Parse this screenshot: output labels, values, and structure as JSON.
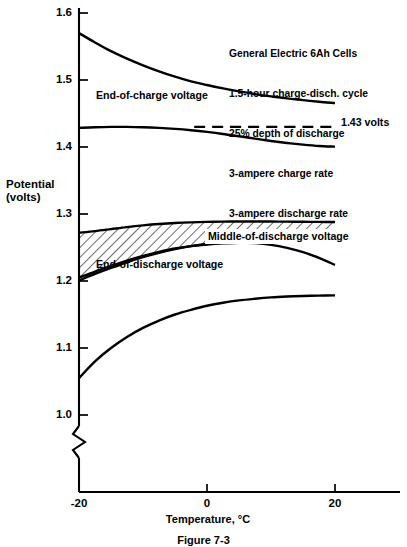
{
  "figure": {
    "caption": "Figure 7-3",
    "annotation_lines": [
      "General Electric 6Ah Cells",
      "1.5-hour charge-disch. cycle",
      "25% depth of discharge",
      "3-ampere charge rate",
      "3-ampere discharge rate"
    ]
  },
  "chart_data": {
    "type": "line",
    "title": "",
    "xlabel": "Temperature, °C",
    "ylabel_lines": [
      "Potential",
      "(volts)"
    ],
    "xlim": [
      -20,
      20
    ],
    "ylim": [
      1.0,
      1.6
    ],
    "xticks": [
      "-20",
      "0",
      "20"
    ],
    "xtick_values": [
      -20,
      0,
      20
    ],
    "yticks": [
      "1.0",
      "1.1",
      "1.2",
      "1.3",
      "1.4",
      "1.5",
      "1.6"
    ],
    "ytick_values": [
      1.0,
      1.1,
      1.2,
      1.3,
      1.4,
      1.5,
      1.6
    ],
    "grid": false,
    "legend": "none",
    "axis_break": {
      "present": true,
      "below_value": 1.0,
      "symbol": "zigzag"
    },
    "annotations": [
      {
        "text": "End-of-charge voltage",
        "x": -15.5,
        "y": 1.468
      },
      {
        "text": "Middle-of-discharge voltage",
        "x": 2.0,
        "y": 1.262
      },
      {
        "text": "End-of-discharge voltage",
        "x": -14.0,
        "y": 1.188
      },
      {
        "text": "1.43 volts",
        "x": 21.5,
        "y": 1.43
      }
    ],
    "series": [
      {
        "name": "End-of-charge voltage",
        "style": "solid",
        "x": [
          -20,
          -17.5,
          -15,
          -12.5,
          -10,
          -7.5,
          -5,
          -2.5,
          0,
          2.5,
          5,
          7.5,
          10,
          12.5,
          15,
          17.5,
          20
        ],
        "values": [
          1.57,
          1.556,
          1.543,
          1.532,
          1.522,
          1.513,
          1.505,
          1.498,
          1.4925,
          1.4875,
          1.483,
          1.479,
          1.4755,
          1.4725,
          1.47,
          1.4675,
          1.4655
        ]
      },
      {
        "name": "Upper discharge-plateau voltage",
        "style": "solid",
        "x": [
          -20,
          -17.5,
          -15,
          -12.5,
          -10,
          -7.5,
          -5,
          -2.5,
          0,
          2.5,
          5,
          7.5,
          10,
          12.5,
          15,
          17.5,
          20
        ],
        "values": [
          1.4285,
          1.4295,
          1.43,
          1.43,
          1.4295,
          1.4285,
          1.427,
          1.425,
          1.4225,
          1.4195,
          1.416,
          1.4125,
          1.409,
          1.406,
          1.4035,
          1.4015,
          1.4005
        ]
      },
      {
        "name": "1.43 volts reference",
        "style": "dashed",
        "x": [
          -2.0,
          20
        ],
        "values": [
          1.43,
          1.43
        ]
      },
      {
        "name": "Middle-of-discharge voltage band, upper bound",
        "style": "solid",
        "x": [
          -20,
          -17.5,
          -15,
          -12.5,
          -10,
          -7.5,
          -5,
          -2.5,
          0,
          2.5,
          5,
          7.5,
          10,
          12.5,
          15,
          17.5,
          20
        ],
        "values": [
          1.272,
          1.2745,
          1.2775,
          1.2805,
          1.283,
          1.285,
          1.2865,
          1.2875,
          1.2882,
          1.2886,
          1.2888,
          1.2888,
          1.2887,
          1.2886,
          1.2884,
          1.2882,
          1.288
        ]
      },
      {
        "name": "Middle-of-discharge voltage band, lower bound",
        "style": "solid",
        "x": [
          -20,
          -17.5,
          -15,
          -12.5,
          -10,
          -7.5,
          -5,
          -2.5,
          0,
          2.5,
          5,
          7.5,
          10,
          12.5,
          15,
          17.5,
          20
        ],
        "values": [
          1.205,
          1.214,
          1.2225,
          1.2305,
          1.2375,
          1.2435,
          1.2485,
          1.252,
          1.2545,
          1.2562,
          1.2572,
          1.2578,
          1.258,
          1.258,
          1.2578,
          1.2575,
          1.2572
        ]
      },
      {
        "name": "Lower discharge-plateau voltage",
        "style": "solid",
        "x": [
          -20,
          -17.5,
          -15,
          -12.5,
          -10,
          -7.5,
          -5,
          -2.5,
          0,
          2.5,
          5,
          7.5,
          10,
          12.5,
          15,
          17.5,
          20
        ],
        "values": [
          1.201,
          1.2105,
          1.2195,
          1.228,
          1.2355,
          1.242,
          1.2475,
          1.252,
          1.2552,
          1.257,
          1.2575,
          1.2565,
          1.254,
          1.2495,
          1.243,
          1.2345,
          1.224
        ]
      },
      {
        "name": "End-of-discharge voltage",
        "style": "solid",
        "x": [
          -20,
          -17.5,
          -15,
          -12.5,
          -10,
          -7.5,
          -5,
          -2.5,
          0,
          2.5,
          5,
          7.5,
          10,
          12.5,
          15,
          17.5,
          20
        ],
        "values": [
          1.055,
          1.08,
          1.1,
          1.1165,
          1.13,
          1.141,
          1.15,
          1.157,
          1.163,
          1.1675,
          1.171,
          1.1735,
          1.1755,
          1.1768,
          1.1777,
          1.1782,
          1.1785
        ]
      }
    ],
    "band": {
      "name": "Middle-of-discharge voltage",
      "fill": "hatched",
      "hatch_angle_deg": 45
    }
  },
  "colors": {
    "ink": "#000000",
    "paper": "#ffffff"
  }
}
